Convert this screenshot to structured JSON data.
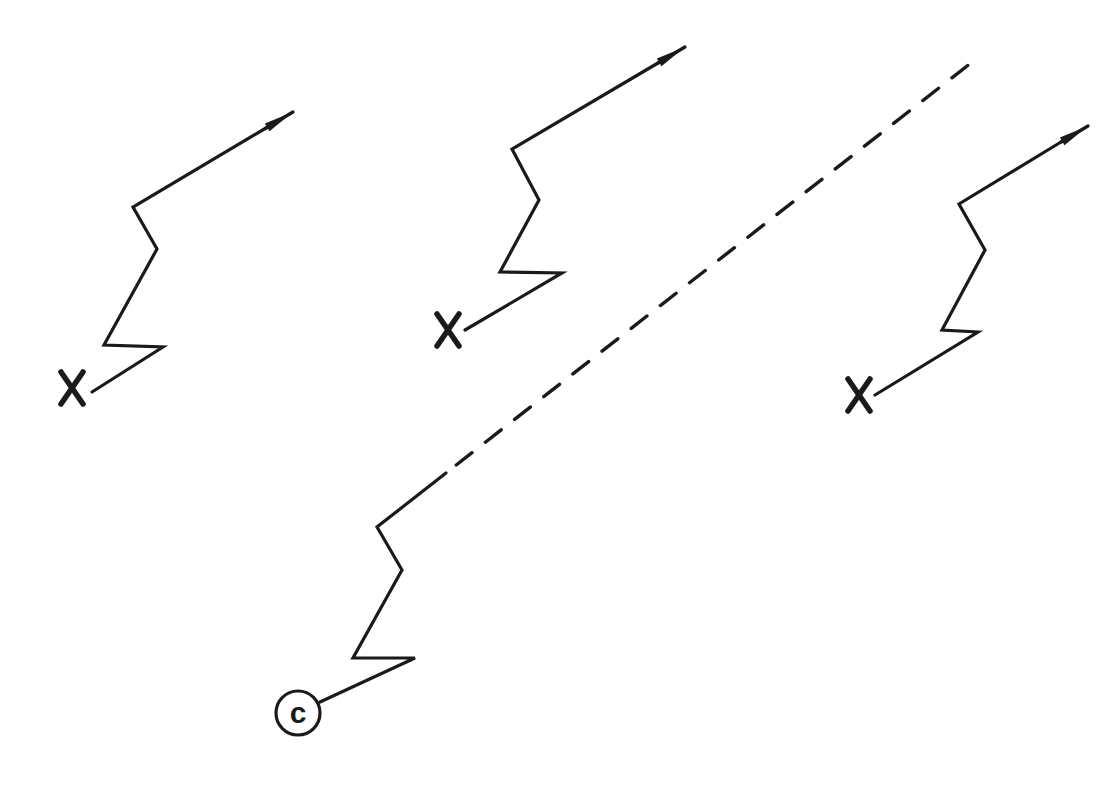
{
  "diagram": {
    "colors": {
      "stroke": "#1a1a1a",
      "background": "#ffffff"
    },
    "tracks": [
      {
        "id": "track-1",
        "start_marker": "X",
        "marker_center": [
          72,
          388
        ],
        "points": [
          [
            92,
            392
          ],
          [
            163,
            347
          ],
          [
            104,
            345
          ],
          [
            157,
            249
          ],
          [
            133,
            207
          ],
          [
            266,
            128
          ]
        ],
        "arrow_tip": [
          293,
          112
        ],
        "end": "arrow"
      },
      {
        "id": "track-2",
        "start_marker": "X",
        "marker_center": [
          448,
          330
        ],
        "points": [
          [
            465,
            330
          ],
          [
            562,
            273
          ],
          [
            500,
            272
          ],
          [
            539,
            200
          ],
          [
            512,
            149
          ],
          [
            658,
            63
          ]
        ],
        "arrow_tip": [
          685,
          47
        ],
        "end": "arrow"
      },
      {
        "id": "track-3",
        "start_marker": "X",
        "marker_center": [
          859,
          395
        ],
        "points": [
          [
            875,
            395
          ],
          [
            978,
            332
          ],
          [
            942,
            330
          ],
          [
            985,
            250
          ],
          [
            959,
            204
          ],
          [
            1061,
            142
          ]
        ],
        "arrow_tip": [
          1088,
          126
        ],
        "end": "arrow"
      },
      {
        "id": "track-c",
        "start_marker": "C",
        "marker_center": [
          298,
          713
        ],
        "marker_radius": 22,
        "points": [
          [
            320,
            702
          ],
          [
            415,
            658
          ],
          [
            353,
            658
          ],
          [
            402,
            570
          ],
          [
            377,
            527
          ],
          [
            446,
            473
          ]
        ],
        "dashed_continuation": [
          [
            446,
            473
          ],
          [
            976,
            59
          ]
        ],
        "end": "dashed"
      }
    ],
    "labels": {
      "x_marker": "X",
      "c_marker": "c"
    }
  }
}
